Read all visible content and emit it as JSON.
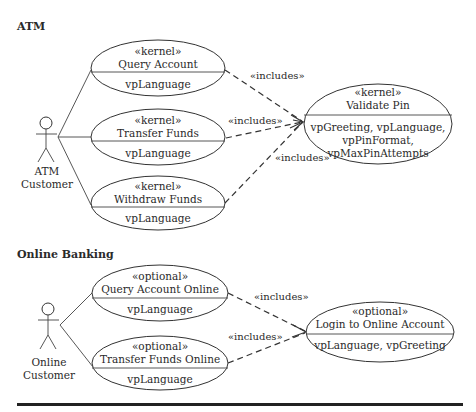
{
  "sections": {
    "atm": {
      "title": "ATM",
      "actor": {
        "line1": "ATM",
        "line2": "Customer"
      },
      "use_cases": [
        {
          "stereotype": "«kernel»",
          "name": "Query Account",
          "variation_points": [
            "vpLanguage"
          ]
        },
        {
          "stereotype": "«kernel»",
          "name": "Transfer Funds",
          "variation_points": [
            "vpLanguage"
          ]
        },
        {
          "stereotype": "«kernel»",
          "name": "Withdraw Funds",
          "variation_points": [
            "vpLanguage"
          ]
        }
      ],
      "included": {
        "stereotype": "«kernel»",
        "name": "Validate Pin",
        "variation_points": [
          "vpGreeting, vpLanguage,",
          "vpPinFormat,",
          "vpMaxPinAttempts"
        ]
      },
      "relations": [
        "«includes»",
        "«includes»",
        "«includes»"
      ]
    },
    "online": {
      "title": "Online Banking",
      "actor": {
        "line1": "Online",
        "line2": "Customer"
      },
      "use_cases": [
        {
          "stereotype": "«optional»",
          "name": "Query Account Online",
          "variation_points": [
            "vpLanguage"
          ]
        },
        {
          "stereotype": "«optional»",
          "name": "Transfer Funds Online",
          "variation_points": [
            "vpLanguage"
          ]
        }
      ],
      "included": {
        "stereotype": "«optional»",
        "name": "Login to Online Account",
        "variation_points": [
          "vpLanguage, vpGreeting"
        ]
      },
      "relations": [
        "«includes»",
        "«includes»"
      ]
    }
  }
}
